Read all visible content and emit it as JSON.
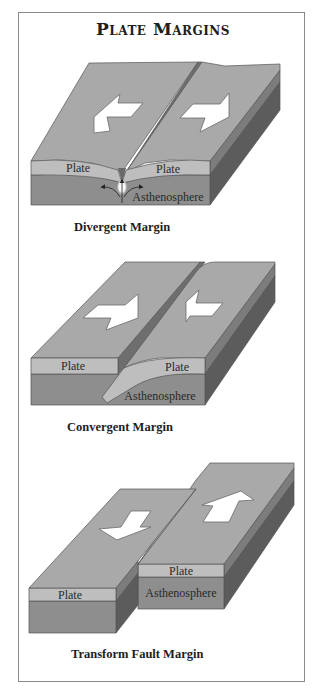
{
  "title": "Plate Margins",
  "diagrams": [
    {
      "caption": "Divergent Margin",
      "labels": {
        "plate_left": "Plate",
        "plate_right": "Plate",
        "asthenosphere": "Asthenosphere"
      },
      "motion": [
        "left-plate-arrow-away",
        "right-plate-arrow-away"
      ]
    },
    {
      "caption": "Convergent Margin",
      "labels": {
        "plate_left": "Plate",
        "plate_right": "Plate",
        "asthenosphere": "Asthenosphere"
      },
      "motion": [
        "left-plate-arrow-toward",
        "right-plate-arrow-toward"
      ]
    },
    {
      "caption": "Transform Fault Margin",
      "labels": {
        "plate_left": "Plate",
        "plate_right": "Plate",
        "asthenosphere": "Asthenosphere"
      },
      "motion": [
        "left-plate-arrow-down",
        "right-plate-arrow-up"
      ]
    }
  ],
  "colors": {
    "top_surface": "#a9a9a9",
    "plate_front": "#bebebe",
    "asthenosphere_front": "#8e8e8e",
    "side_plate": "#7c7c7c",
    "side_asthenosphere": "#5c5c5c",
    "border": "#8a8a8a"
  }
}
